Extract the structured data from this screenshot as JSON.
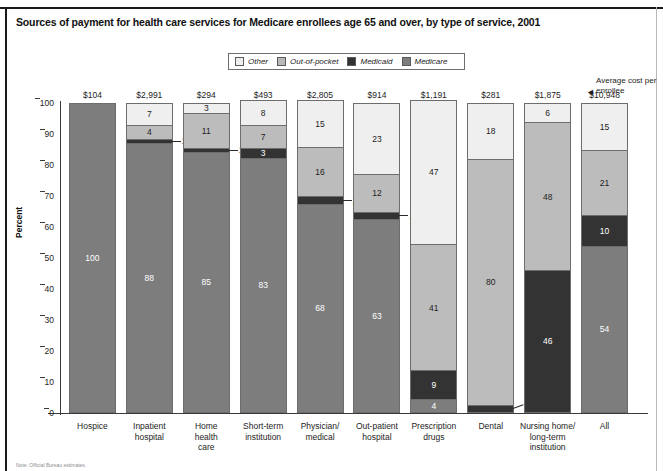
{
  "title": "Sources of payment for health care services for Medicare enrollees age 65 and over, by type of service, 2001",
  "note": "Note: Official Bureau estimates.",
  "annotation": {
    "text": "Average cost per enrollee",
    "arrow": "◄"
  },
  "axis": {
    "ylabel": "Percent",
    "yticks": [
      "0",
      "10",
      "20",
      "30",
      "40",
      "50",
      "60",
      "70",
      "80",
      "90",
      "100"
    ]
  },
  "legend": {
    "items": [
      {
        "label": "Other",
        "color": "#eeeeee"
      },
      {
        "label": "Out-of-pocket",
        "color": "#b9b9b9"
      },
      {
        "label": "Medicaid",
        "color": "#333333"
      },
      {
        "label": "Medicare",
        "color": "#7d7d7d"
      }
    ]
  },
  "chart_data": {
    "type": "bar",
    "subtype": "stacked-percent-column",
    "title": "Sources of payment for health care services for Medicare enrollees age 65 and over, by type of service, 2001",
    "xlabel": "",
    "ylabel": "Percent",
    "ylim": [
      0,
      100
    ],
    "yticks": [
      0,
      10,
      20,
      30,
      40,
      50,
      60,
      70,
      80,
      90,
      100
    ],
    "grid": false,
    "legend_position": "top-center",
    "categories": [
      "Hospice",
      "Inpatient hospital",
      "Home health care",
      "Short-term institution",
      "Physician/ medical",
      "Out-patient hospital",
      "Prescription drugs",
      "Dental",
      "Nursing home/ long-term institution",
      "All"
    ],
    "category_lines": [
      [
        "Hospice"
      ],
      [
        "Inpatient",
        "hospital"
      ],
      [
        "Home",
        "health",
        "care"
      ],
      [
        "Short-term",
        "institution"
      ],
      [
        "Physician/",
        "medical"
      ],
      [
        "Out-patient",
        "hospital"
      ],
      [
        "Prescription",
        "drugs"
      ],
      [
        "Dental"
      ],
      [
        "Nursing home/",
        "long-term",
        "institution"
      ],
      [
        "All"
      ]
    ],
    "series": [
      {
        "name": "Other",
        "color": "#eeeeee",
        "values": [
          0,
          7,
          3,
          8,
          15,
          23,
          47,
          18,
          6,
          15
        ]
      },
      {
        "name": "Out-of-pocket",
        "color": "#b9b9b9",
        "values": [
          0,
          4,
          11,
          7,
          16,
          12,
          41,
          80,
          48,
          21
        ]
      },
      {
        "name": "Medicaid",
        "color": "#333333",
        "values": [
          0,
          1,
          1,
          3,
          2,
          2,
          9,
          1,
          46,
          10
        ]
      },
      {
        "name": "Medicare",
        "color": "#7d7d7d",
        "values": [
          100,
          88,
          85,
          83,
          68,
          63,
          4,
          0,
          0,
          54
        ]
      }
    ],
    "average_cost_per_enrollee": [
      "$104",
      "$2,991",
      "$294",
      "$493",
      "$2,805",
      "$914",
      "$1,191",
      "$281",
      "$1,875",
      "$10,948"
    ],
    "annotation": "Average cost per enrollee"
  },
  "bars": [
    {
      "category_lines": [
        "Hospice"
      ],
      "cost": "$104",
      "segments": [
        {
          "name": "Medicare",
          "tone": "mid",
          "value": 100,
          "label": "100",
          "callout": false
        }
      ]
    },
    {
      "category_lines": [
        "Inpatient",
        "hospital"
      ],
      "cost": "$2,991",
      "segments": [
        {
          "name": "Other",
          "tone": "white",
          "value": 7,
          "label": "7",
          "callout": false
        },
        {
          "name": "Out-of-pocket",
          "tone": "light",
          "value": 4,
          "label": "4",
          "callout": false
        },
        {
          "name": "Medicaid",
          "tone": "dark",
          "value": 1,
          "label": "1",
          "callout": true
        },
        {
          "name": "Medicare",
          "tone": "mid",
          "value": 88,
          "label": "88",
          "callout": false
        }
      ]
    },
    {
      "category_lines": [
        "Home",
        "health",
        "care"
      ],
      "cost": "$294",
      "segments": [
        {
          "name": "Other",
          "tone": "white",
          "value": 3,
          "label": "3",
          "callout": false
        },
        {
          "name": "Out-of-pocket",
          "tone": "light",
          "value": 11,
          "label": "11",
          "callout": false
        },
        {
          "name": "Medicaid",
          "tone": "dark",
          "value": 1,
          "label": "1",
          "callout": true
        },
        {
          "name": "Medicare",
          "tone": "mid",
          "value": 85,
          "label": "85",
          "callout": false
        }
      ]
    },
    {
      "category_lines": [
        "Short-term",
        "institution"
      ],
      "cost": "$493",
      "segments": [
        {
          "name": "Other",
          "tone": "white",
          "value": 8,
          "label": "8",
          "callout": false
        },
        {
          "name": "Out-of-pocket",
          "tone": "light",
          "value": 7,
          "label": "7",
          "callout": false
        },
        {
          "name": "Medicaid",
          "tone": "dark",
          "value": 3,
          "label": "3",
          "callout": false
        },
        {
          "name": "Medicare",
          "tone": "mid",
          "value": 83,
          "label": "83",
          "callout": false
        }
      ]
    },
    {
      "category_lines": [
        "Physician/",
        "medical"
      ],
      "cost": "$2,805",
      "segments": [
        {
          "name": "Other",
          "tone": "white",
          "value": 15,
          "label": "15",
          "callout": false
        },
        {
          "name": "Out-of-pocket",
          "tone": "light",
          "value": 16,
          "label": "16",
          "callout": false
        },
        {
          "name": "Medicaid",
          "tone": "dark",
          "value": 2,
          "label": "2",
          "callout": true
        },
        {
          "name": "Medicare",
          "tone": "mid",
          "value": 68,
          "label": "68",
          "callout": false
        }
      ]
    },
    {
      "category_lines": [
        "Out-patient",
        "hospital"
      ],
      "cost": "$914",
      "segments": [
        {
          "name": "Other",
          "tone": "white",
          "value": 23,
          "label": "23",
          "callout": false
        },
        {
          "name": "Out-of-pocket",
          "tone": "light",
          "value": 12,
          "label": "12",
          "callout": false
        },
        {
          "name": "Medicaid",
          "tone": "dark",
          "value": 2,
          "label": "2",
          "callout": true
        },
        {
          "name": "Medicare",
          "tone": "mid",
          "value": 63,
          "label": "63",
          "callout": false
        }
      ]
    },
    {
      "category_lines": [
        "Prescription",
        "drugs"
      ],
      "cost": "$1,191",
      "segments": [
        {
          "name": "Other",
          "tone": "white",
          "value": 47,
          "label": "47",
          "callout": false
        },
        {
          "name": "Out-of-pocket",
          "tone": "light",
          "value": 41,
          "label": "41",
          "callout": false
        },
        {
          "name": "Medicaid",
          "tone": "dark",
          "value": 9,
          "label": "9",
          "callout": false
        },
        {
          "name": "Medicare",
          "tone": "mid",
          "value": 4,
          "label": "4",
          "callout": false
        }
      ]
    },
    {
      "category_lines": [
        "Dental"
      ],
      "cost": "$281",
      "segments": [
        {
          "name": "Other",
          "tone": "white",
          "value": 18,
          "label": "18",
          "callout": false
        },
        {
          "name": "Out-of-pocket",
          "tone": "light",
          "value": 80,
          "label": "80",
          "callout": false
        },
        {
          "name": "Medicaid",
          "tone": "dark",
          "value": 2,
          "label": "1",
          "callout": true,
          "slant": true
        }
      ]
    },
    {
      "category_lines": [
        "Nursing home/",
        "long-term",
        "institution"
      ],
      "cost": "$1,875",
      "segments": [
        {
          "name": "Other",
          "tone": "white",
          "value": 6,
          "label": "6",
          "callout": false
        },
        {
          "name": "Out-of-pocket",
          "tone": "light",
          "value": 48,
          "label": "48",
          "callout": false
        },
        {
          "name": "Medicaid",
          "tone": "dark",
          "value": 46,
          "label": "46",
          "callout": false
        }
      ]
    },
    {
      "category_lines": [
        "All"
      ],
      "cost": "$10,948",
      "segments": [
        {
          "name": "Other",
          "tone": "white",
          "value": 15,
          "label": "15",
          "callout": false
        },
        {
          "name": "Out-of-pocket",
          "tone": "light",
          "value": 21,
          "label": "21",
          "callout": false
        },
        {
          "name": "Medicaid",
          "tone": "dark",
          "value": 10,
          "label": "10",
          "callout": false
        },
        {
          "name": "Medicare",
          "tone": "mid",
          "value": 54,
          "label": "54",
          "callout": false
        }
      ]
    }
  ]
}
